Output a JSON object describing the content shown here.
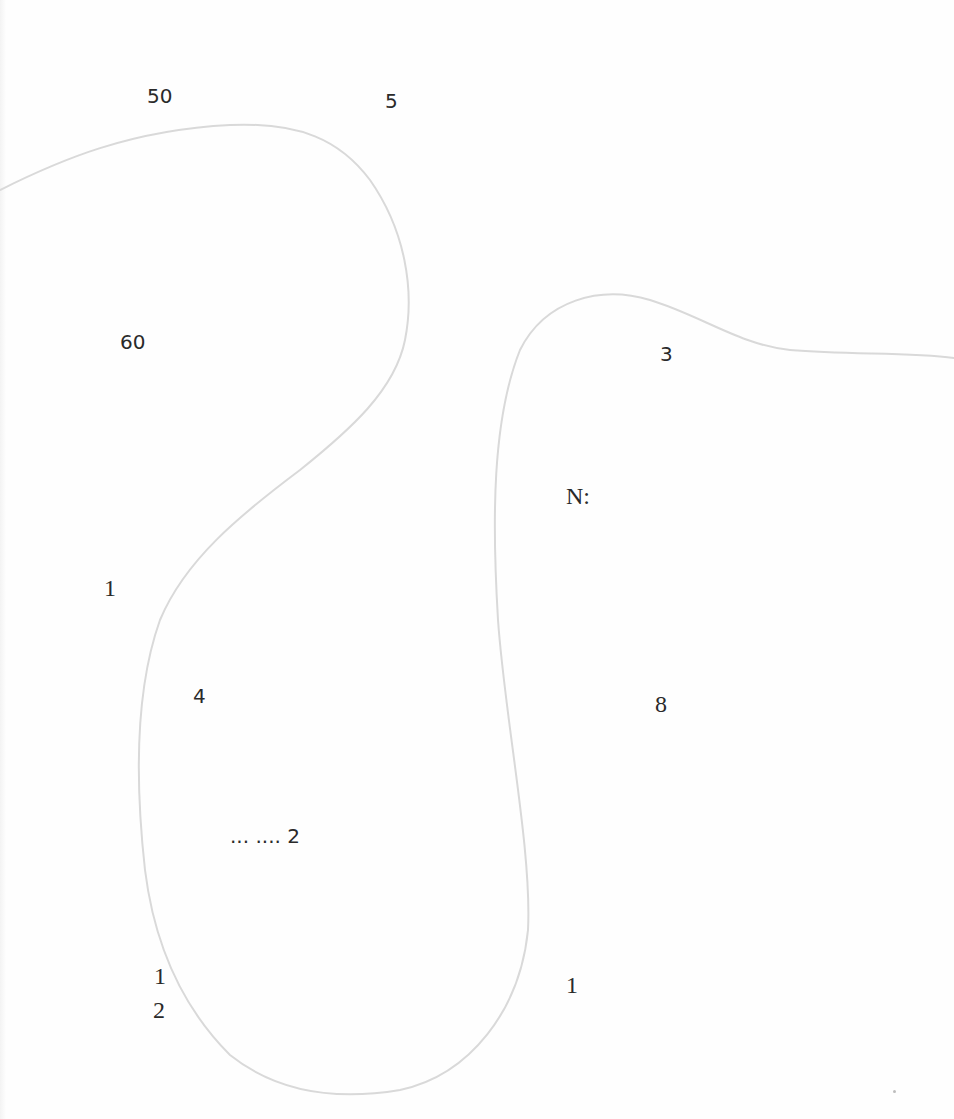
{
  "labels": {
    "l50": "50",
    "l5": "5",
    "l60": "60",
    "l3": "3",
    "lN": "N:",
    "l1a": "1",
    "l4": "4",
    "l8": "8",
    "ldots2": "... .... 2",
    "l1b": "1",
    "l2": "2",
    "l1c": "1"
  },
  "colors": {
    "background": "#fefefe",
    "curve": "#d6d6d6",
    "text": "#2a2a2a"
  }
}
